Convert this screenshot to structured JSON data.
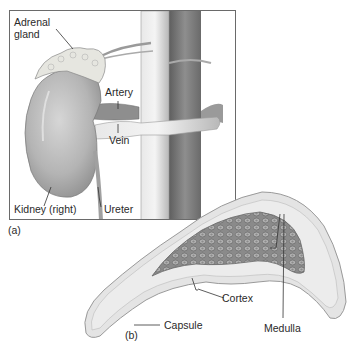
{
  "figure": {
    "panel_a": {
      "marker": "(a)",
      "labels": {
        "adrenal_line1": "Adrenal",
        "adrenal_line2": "gland",
        "artery": "Artery",
        "vein": "Vein",
        "kidney": "Kidney (right)",
        "ureter": "Ureter"
      }
    },
    "panel_b": {
      "marker": "(b)",
      "labels": {
        "cortex": "Cortex",
        "capsule": "Capsule",
        "medulla": "Medulla"
      }
    },
    "colors": {
      "frame": "#6a6a6a",
      "kidney": "#b8b8b8",
      "vessel": "#c9c9c9",
      "vessel_dark": "#7a7a7a",
      "adrenal": "#e6e6e0",
      "cortex": "#e2e2e2",
      "medulla": "#8c8c8c",
      "leader": "#333333"
    }
  }
}
